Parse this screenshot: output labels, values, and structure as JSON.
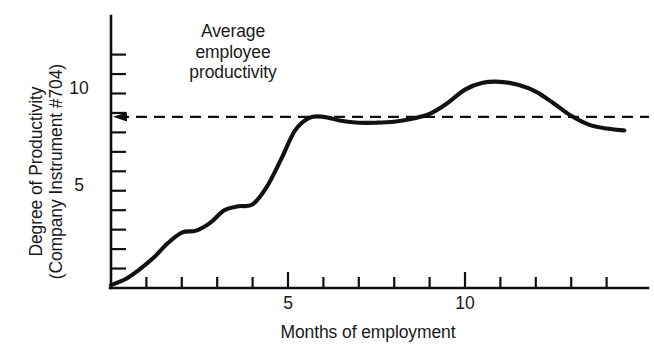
{
  "chart_data": {
    "type": "line",
    "title": "",
    "xlabel": "Months of employment",
    "ylabel_line1": "Degree of Productivity",
    "ylabel_line2": "(Company Instrument #704)",
    "xlim": [
      0,
      14.5
    ],
    "ylim": [
      0,
      12.1
    ],
    "xticks": [
      1,
      2,
      3,
      4,
      5,
      6,
      7,
      8,
      9,
      10,
      11,
      12,
      13,
      14
    ],
    "xtick_labels_shown": [
      {
        "value": 5,
        "label": "5"
      },
      {
        "value": 10,
        "label": "10"
      }
    ],
    "yticks": [
      1,
      2,
      3,
      4,
      5,
      6,
      7,
      8,
      9,
      10,
      11,
      12
    ],
    "ytick_labels_shown": [
      {
        "value": 5,
        "label": "5"
      },
      {
        "value": 10,
        "label": "10"
      }
    ],
    "grid": false,
    "legend": null,
    "annotations": [
      {
        "name": "average-employee-productivity",
        "lines": [
          "Average",
          "employee",
          "productivity"
        ],
        "arrow": "points left to y-axis at y = 8.8",
        "reference_line_y": 8.8,
        "reference_line_style": "dashed"
      }
    ],
    "series": [
      {
        "name": "Productivity learning curve",
        "style": "solid",
        "color": "#111111",
        "x": [
          0.0,
          0.4,
          0.8,
          1.2,
          1.6,
          2.0,
          2.4,
          2.8,
          3.2,
          3.6,
          4.0,
          4.4,
          4.8,
          5.2,
          5.6,
          6.0,
          6.5,
          7.0,
          7.5,
          8.0,
          8.5,
          9.0,
          9.5,
          10.0,
          10.5,
          11.0,
          11.5,
          12.0,
          12.5,
          13.0,
          13.5,
          14.0,
          14.5
        ],
        "y": [
          0.15,
          0.45,
          0.95,
          1.55,
          2.3,
          2.85,
          2.95,
          3.35,
          4.0,
          4.2,
          4.3,
          5.2,
          6.6,
          8.1,
          8.75,
          8.8,
          8.6,
          8.5,
          8.5,
          8.55,
          8.7,
          8.95,
          9.5,
          10.2,
          10.55,
          10.6,
          10.45,
          10.1,
          9.5,
          8.85,
          8.4,
          8.2,
          8.1
        ]
      }
    ]
  },
  "axis": {
    "y_label_5": "5",
    "y_label_10": "10",
    "x_label_5": "5",
    "x_label_10": "10"
  }
}
